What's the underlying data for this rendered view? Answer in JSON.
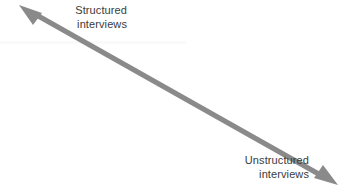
{
  "diagram": {
    "type": "continuum-double-arrow",
    "orientation": "diagonal-down-right",
    "background_color": "#ffffff",
    "arrow": {
      "name": "double-headed-continuum-arrow",
      "color": "#8a8a8a",
      "shaft_thickness_px": 5,
      "start_point": {
        "x": 19,
        "y": 5
      },
      "end_point": {
        "x": 338,
        "y": 185
      },
      "arrowhead_start": "structured-end",
      "arrowhead_end": "unstructured-end",
      "arrowhead_length_px": 20,
      "arrowhead_width_px": 16
    },
    "labels": {
      "structured": {
        "line1": "Structured",
        "line2": "interviews",
        "align": "right",
        "color": "#3b3b3b"
      },
      "unstructured": {
        "line1": "Unstructured",
        "line2": "interviews",
        "align": "right",
        "color": "#3b3b3b"
      }
    }
  }
}
